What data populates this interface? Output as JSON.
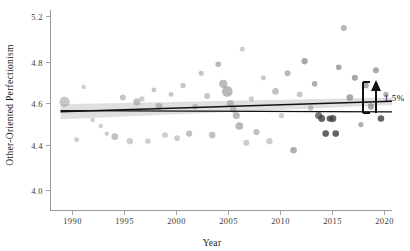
{
  "figure": {
    "background": "#ffffff",
    "width": 410,
    "height": 251
  },
  "axes": {
    "x_title": "Year",
    "y_title": "Other-Oriented Perfectionism",
    "x_ticks": [
      "1990",
      "1995",
      "2000",
      "2005",
      "2010",
      "2015",
      "2020"
    ],
    "y_ticks": [
      "5.2",
      "4.8",
      "4.6",
      "4.4",
      "4.0"
    ],
    "axis_color": "#9a9a9a"
  },
  "annotation": {
    "label": "1.5%",
    "arrow_color": "#111111"
  },
  "chart_data": {
    "type": "scatter",
    "title": "",
    "xlabel": "Year",
    "ylabel": "Other-Oriented Perfectionism",
    "xlim": [
      1987,
      2021
    ],
    "ylim": [
      3.95,
      5.28
    ],
    "xticks": [
      1990,
      1995,
      2000,
      2005,
      2010,
      2015,
      2020
    ],
    "yticks": [
      5.2,
      4.8,
      4.6,
      4.4,
      4.0
    ],
    "grid": false,
    "legend": null,
    "point_color": "#8c8c8c",
    "point_color_dark": "#3a3a3a",
    "point_opacity_range": [
      0.35,
      0.85
    ],
    "size_meaning": "sample size (bubble area)",
    "points": [
      {
        "x": 1988.4,
        "y": 4.67,
        "s": 52,
        "c": "#9b9b9b",
        "o": 0.55
      },
      {
        "x": 1989.6,
        "y": 4.42,
        "s": 12,
        "c": "#9b9b9b",
        "o": 0.5
      },
      {
        "x": 1990.3,
        "y": 4.77,
        "s": 10,
        "c": "#9b9b9b",
        "o": 0.5
      },
      {
        "x": 1991.2,
        "y": 4.55,
        "s": 10,
        "c": "#a0a0a0",
        "o": 0.5
      },
      {
        "x": 1992.0,
        "y": 4.51,
        "s": 10,
        "c": "#a0a0a0",
        "o": 0.5
      },
      {
        "x": 1992.6,
        "y": 4.46,
        "s": 10,
        "c": "#a0a0a0",
        "o": 0.5
      },
      {
        "x": 1993.4,
        "y": 4.44,
        "s": 22,
        "c": "#8e8e8e",
        "o": 0.55
      },
      {
        "x": 1994.2,
        "y": 4.7,
        "s": 18,
        "c": "#8e8e8e",
        "o": 0.5
      },
      {
        "x": 1994.9,
        "y": 4.41,
        "s": 20,
        "c": "#9b9b9b",
        "o": 0.5
      },
      {
        "x": 1995.6,
        "y": 4.67,
        "s": 26,
        "c": "#8e8e8e",
        "o": 0.55
      },
      {
        "x": 1996.1,
        "y": 4.69,
        "s": 14,
        "c": "#9b9b9b",
        "o": 0.5
      },
      {
        "x": 1996.7,
        "y": 4.41,
        "s": 14,
        "c": "#9b9b9b",
        "o": 0.5
      },
      {
        "x": 1997.3,
        "y": 4.75,
        "s": 12,
        "c": "#8e8e8e",
        "o": 0.5
      },
      {
        "x": 1997.8,
        "y": 4.64,
        "s": 24,
        "c": "#8e8e8e",
        "o": 0.55
      },
      {
        "x": 1998.4,
        "y": 4.45,
        "s": 18,
        "c": "#9b9b9b",
        "o": 0.5
      },
      {
        "x": 1999.0,
        "y": 4.72,
        "s": 12,
        "c": "#8e8e8e",
        "o": 0.5
      },
      {
        "x": 1999.6,
        "y": 4.43,
        "s": 16,
        "c": "#9b9b9b",
        "o": 0.5
      },
      {
        "x": 2000.2,
        "y": 4.78,
        "s": 14,
        "c": "#8e8e8e",
        "o": 0.5
      },
      {
        "x": 2000.8,
        "y": 4.46,
        "s": 20,
        "c": "#8e8e8e",
        "o": 0.55
      },
      {
        "x": 2001.4,
        "y": 4.64,
        "s": 16,
        "c": "#9b9b9b",
        "o": 0.5
      },
      {
        "x": 2002.0,
        "y": 4.86,
        "s": 14,
        "c": "#8e8e8e",
        "o": 0.5
      },
      {
        "x": 2002.6,
        "y": 4.71,
        "s": 18,
        "c": "#8e8e8e",
        "o": 0.5
      },
      {
        "x": 2003.1,
        "y": 4.45,
        "s": 22,
        "c": "#8e8e8e",
        "o": 0.55
      },
      {
        "x": 2003.7,
        "y": 4.92,
        "s": 16,
        "c": "#7f7f7f",
        "o": 0.55
      },
      {
        "x": 2004.2,
        "y": 4.79,
        "s": 34,
        "c": "#8e8e8e",
        "o": 0.6
      },
      {
        "x": 2004.6,
        "y": 4.74,
        "s": 58,
        "c": "#8a8a8a",
        "o": 0.6
      },
      {
        "x": 2004.9,
        "y": 4.66,
        "s": 24,
        "c": "#8e8e8e",
        "o": 0.55
      },
      {
        "x": 2005.2,
        "y": 4.62,
        "s": 20,
        "c": "#8e8e8e",
        "o": 0.55
      },
      {
        "x": 2005.5,
        "y": 4.58,
        "s": 26,
        "c": "#8a8a8a",
        "o": 0.6
      },
      {
        "x": 2005.8,
        "y": 4.51,
        "s": 30,
        "c": "#8a8a8a",
        "o": 0.6
      },
      {
        "x": 2006.1,
        "y": 5.02,
        "s": 12,
        "c": "#9b9b9b",
        "o": 0.5
      },
      {
        "x": 2006.5,
        "y": 4.4,
        "s": 18,
        "c": "#9b9b9b",
        "o": 0.5
      },
      {
        "x": 2007.0,
        "y": 4.69,
        "s": 14,
        "c": "#9b9b9b",
        "o": 0.5
      },
      {
        "x": 2007.5,
        "y": 4.47,
        "s": 20,
        "c": "#8e8e8e",
        "o": 0.55
      },
      {
        "x": 2008.2,
        "y": 4.83,
        "s": 12,
        "c": "#8e8e8e",
        "o": 0.5
      },
      {
        "x": 2008.8,
        "y": 4.41,
        "s": 20,
        "c": "#9b9b9b",
        "o": 0.5
      },
      {
        "x": 2009.4,
        "y": 4.74,
        "s": 22,
        "c": "#8e8e8e",
        "o": 0.55
      },
      {
        "x": 2010.0,
        "y": 4.58,
        "s": 14,
        "c": "#9b9b9b",
        "o": 0.5
      },
      {
        "x": 2010.6,
        "y": 4.86,
        "s": 18,
        "c": "#7f7f7f",
        "o": 0.55
      },
      {
        "x": 2011.2,
        "y": 4.35,
        "s": 22,
        "c": "#7a7a7a",
        "o": 0.6
      },
      {
        "x": 2011.8,
        "y": 4.72,
        "s": 16,
        "c": "#8e8e8e",
        "o": 0.5
      },
      {
        "x": 2012.3,
        "y": 4.94,
        "s": 20,
        "c": "#6f6f6f",
        "o": 0.6
      },
      {
        "x": 2012.9,
        "y": 4.63,
        "s": 14,
        "c": "#8e8e8e",
        "o": 0.5
      },
      {
        "x": 2013.3,
        "y": 4.79,
        "s": 16,
        "c": "#7a7a7a",
        "o": 0.6
      },
      {
        "x": 2013.7,
        "y": 4.58,
        "s": 26,
        "c": "#4a4a4a",
        "o": 0.75
      },
      {
        "x": 2014.0,
        "y": 4.56,
        "s": 24,
        "c": "#3f3f3f",
        "o": 0.8
      },
      {
        "x": 2014.4,
        "y": 4.46,
        "s": 22,
        "c": "#3f3f3f",
        "o": 0.8
      },
      {
        "x": 2014.8,
        "y": 4.56,
        "s": 20,
        "c": "#3f3f3f",
        "o": 0.8
      },
      {
        "x": 2015.1,
        "y": 4.56,
        "s": 26,
        "c": "#3f3f3f",
        "o": 0.8
      },
      {
        "x": 2015.4,
        "y": 4.46,
        "s": 22,
        "c": "#3f3f3f",
        "o": 0.8
      },
      {
        "x": 2015.7,
        "y": 4.9,
        "s": 16,
        "c": "#6f6f6f",
        "o": 0.6
      },
      {
        "x": 2016.2,
        "y": 5.16,
        "s": 18,
        "c": "#7a7a7a",
        "o": 0.55
      },
      {
        "x": 2016.8,
        "y": 4.7,
        "s": 22,
        "c": "#6f6f6f",
        "o": 0.6
      },
      {
        "x": 2017.3,
        "y": 4.83,
        "s": 18,
        "c": "#6a6a6a",
        "o": 0.6
      },
      {
        "x": 2017.9,
        "y": 4.52,
        "s": 14,
        "c": "#7a7a7a",
        "o": 0.6
      },
      {
        "x": 2018.4,
        "y": 4.78,
        "s": 16,
        "c": "#6f6f6f",
        "o": 0.6
      },
      {
        "x": 2018.9,
        "y": 4.64,
        "s": 20,
        "c": "#6a6a6a",
        "o": 0.6
      },
      {
        "x": 2019.4,
        "y": 4.88,
        "s": 18,
        "c": "#6f6f6f",
        "o": 0.6
      },
      {
        "x": 2019.9,
        "y": 4.56,
        "s": 22,
        "c": "#3f3f3f",
        "o": 0.8
      },
      {
        "x": 2020.4,
        "y": 4.72,
        "s": 14,
        "c": "#7a7a7a",
        "o": 0.6
      }
    ],
    "trend_line": {
      "label": "fitted trend",
      "x": [
        1988,
        2021
      ],
      "y": [
        4.605,
        4.675
      ],
      "color": "#111111"
    },
    "reference_line": {
      "label": "flat reference (no change)",
      "x": [
        1988,
        2021
      ],
      "y": [
        4.612,
        4.604
      ],
      "color": "#111111"
    },
    "ci_band": {
      "x": [
        1988,
        2021
      ],
      "upper": [
        4.655,
        4.7
      ],
      "lower": [
        4.555,
        4.65
      ],
      "color": "#b9b9b9"
    },
    "annotations": [
      {
        "text": "1.5%",
        "x": 2021.5,
        "y": 4.64,
        "type": "arrow-up"
      }
    ]
  }
}
